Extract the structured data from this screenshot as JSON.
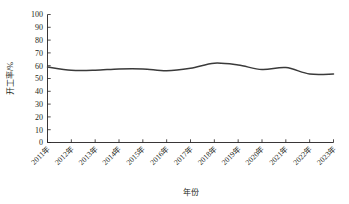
{
  "chart_data": {
    "type": "line",
    "title": "",
    "xlabel": "年份",
    "ylabel": "开工率/%",
    "xlim": [
      2011,
      2023
    ],
    "ylim": [
      0,
      100
    ],
    "ytick_step": 10,
    "grid": false,
    "legend": null,
    "line_color": "#3a3a3a",
    "categories": [
      "2011年",
      "2012年",
      "2013年",
      "2014年",
      "2015年",
      "2016年",
      "2017年",
      "2018年",
      "2019年",
      "2020年",
      "2021年",
      "2022年",
      "2023年"
    ],
    "x": [
      2011,
      2012,
      2013,
      2014,
      2015,
      2016,
      2017,
      2018,
      2019,
      2020,
      2021,
      2022,
      2023
    ],
    "values": [
      59,
      56.5,
      56.5,
      57.5,
      57.5,
      56,
      58,
      62,
      60.5,
      57,
      58.5,
      53.5,
      53.5
    ],
    "series": [
      {
        "name": "开工率",
        "values": [
          59,
          56.5,
          56.5,
          57.5,
          57.5,
          56,
          58,
          62,
          60.5,
          57,
          58.5,
          53.5,
          53.5
        ]
      }
    ],
    "ytick_labels": [
      "0",
      "10",
      "20",
      "30",
      "40",
      "50",
      "60",
      "70",
      "80",
      "90",
      "100"
    ],
    "ytick_values": [
      0,
      10,
      20,
      30,
      40,
      50,
      60,
      70,
      80,
      90,
      100
    ]
  }
}
